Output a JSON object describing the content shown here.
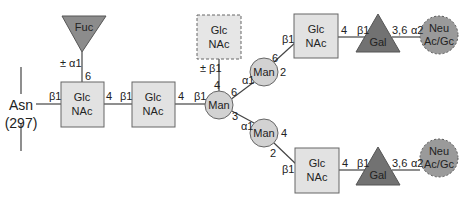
{
  "colors": {
    "glcnac_fill": "#e2e2e2",
    "man_fill": "#d2d2d2",
    "fuc_fill": "#8c8c8c",
    "gal_fill": "#727272",
    "neu_fill": "#9a9a9a",
    "stroke": "#555555"
  },
  "anchor": {
    "residue": "Asn",
    "position": "(297)"
  },
  "nodes": {
    "fuc": {
      "label": "Fuc",
      "shape": "triangle-down"
    },
    "glcnac1": {
      "line1": "Glc",
      "line2": "NAc",
      "shape": "square"
    },
    "glcnac2": {
      "line1": "Glc",
      "line2": "NAc",
      "shape": "square"
    },
    "man_core": {
      "label": "Man",
      "shape": "circle"
    },
    "glcnac_bisect": {
      "line1": "Glc",
      "line2": "NAc",
      "shape": "square-dashed"
    },
    "man_upper": {
      "label": "Man",
      "shape": "circle"
    },
    "man_lower": {
      "label": "Man",
      "shape": "circle"
    },
    "glcnac_upper": {
      "line1": "Glc",
      "line2": "NAc",
      "shape": "square"
    },
    "glcnac_lower": {
      "line1": "Glc",
      "line2": "NAc",
      "shape": "square"
    },
    "gal_upper": {
      "label": "Gal",
      "shape": "triangle-up"
    },
    "gal_lower": {
      "label": "Gal",
      "shape": "triangle-up"
    },
    "neu_upper": {
      "line1": "Neu",
      "line2": "Ac/Gc",
      "shape": "circle-dashed"
    },
    "neu_lower": {
      "line1": "Neu",
      "line2": "Ac/Gc",
      "shape": "circle-dashed"
    }
  },
  "linkages": {
    "asn_glcnac1": "β1",
    "fuc_anomer": "± α1",
    "fuc_pos": "6",
    "glcnac1_pos": "4",
    "glcnac2_anomer": "β1",
    "glcnac2_pos": "4",
    "man_core_anomer": "β1",
    "bisect_anomer": "± β1",
    "bisect_pos": "4",
    "man_core_pos6": "6",
    "man_core_pos3": "3",
    "man_upper_anomer": "α1",
    "man_upper_pos6": "6",
    "man_upper_pos2": "2",
    "man_lower_anomer": "α1",
    "man_lower_pos4": "4",
    "man_lower_pos2": "2",
    "glcnac_upper_anomer": "β1",
    "glcnac_upper_pos": "4",
    "gal_upper_anomer": "β1",
    "gal_upper_pos": "3,6",
    "neu_upper_anomer": "α2",
    "glcnac_lower_anomer": "β1",
    "glcnac_lower_pos": "4",
    "gal_lower_anomer": "β1",
    "gal_lower_pos": "3,6",
    "neu_lower_anomer": "α2"
  }
}
